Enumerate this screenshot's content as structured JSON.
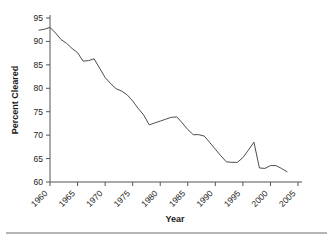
{
  "chart_data": {
    "type": "line",
    "title": "",
    "xlabel": "Year",
    "ylabel": "Percent Cleared",
    "xlim": [
      1958,
      2005
    ],
    "ylim": [
      60,
      97
    ],
    "grid": false,
    "legend": null,
    "xticks": [
      "1960",
      "1965",
      "1970",
      "1975",
      "1980",
      "1985",
      "1990",
      "1995",
      "2000",
      "2005"
    ],
    "xtick_values": [
      1960,
      1965,
      1970,
      1975,
      1980,
      1985,
      1990,
      1995,
      2000,
      2005
    ],
    "yticks": [
      "60",
      "65",
      "70",
      "75",
      "80",
      "85",
      "90",
      "95"
    ],
    "ytick_values": [
      60,
      65,
      70,
      75,
      80,
      85,
      90,
      95
    ],
    "series": [
      {
        "name": "Percent Cleared",
        "color": "#4d4d4d",
        "x": [
          1958,
          1959,
          1960,
          1961,
          1962,
          1963,
          1964,
          1965,
          1966,
          1967,
          1968,
          1969,
          1970,
          1971,
          1972,
          1973,
          1974,
          1975,
          1976,
          1977,
          1978,
          1979,
          1980,
          1981,
          1982,
          1983,
          1984,
          1985,
          1986,
          1987,
          1988,
          1989,
          1990,
          1991,
          1992,
          1993,
          1994,
          1995,
          1996,
          1997,
          1998,
          1999,
          2000,
          2001,
          2002,
          2003
        ],
        "values": [
          92.4,
          92.6,
          93.0,
          91.8,
          90.4,
          89.6,
          88.5,
          87.6,
          85.8,
          85.9,
          86.3,
          84.3,
          82.3,
          81.0,
          79.9,
          79.4,
          78.6,
          77.3,
          75.7,
          74.3,
          72.2,
          72.6,
          73.0,
          73.4,
          73.8,
          73.9,
          72.6,
          71.2,
          70.1,
          70.1,
          69.8,
          68.4,
          67.0,
          65.6,
          64.3,
          64.2,
          64.2,
          65.2,
          66.8,
          68.5,
          63.0,
          62.9,
          63.5,
          63.5,
          62.9,
          62.2
        ]
      }
    ]
  },
  "axis": {
    "y_title": "Percent Cleared",
    "x_title": "Year"
  }
}
